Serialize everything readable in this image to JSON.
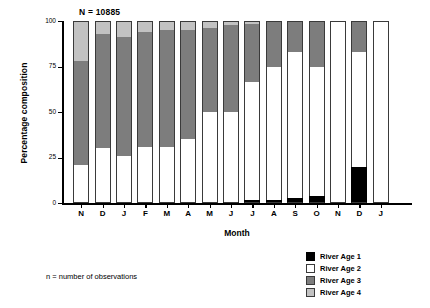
{
  "chart_data": {
    "type": "bar",
    "subtype": "stacked-percentage",
    "title": "",
    "annotation": "N = 10885",
    "xlabel": "Month",
    "ylabel": "Percentage composition",
    "ylim": [
      0,
      100
    ],
    "yticks": [
      0,
      25,
      50,
      75,
      100
    ],
    "ytick_labels": [
      "0",
      "25",
      "50",
      "75",
      "100"
    ],
    "grid": false,
    "legend_position": "bottom-right",
    "categories": [
      "N",
      "D",
      "J",
      "F",
      "M",
      "A",
      "M",
      "J",
      "J",
      "A",
      "S",
      "O",
      "N",
      "D",
      "J"
    ],
    "series": [
      {
        "name": "River Age 1",
        "color": "#000000",
        "values": [
          0,
          0,
          0,
          0,
          0,
          0,
          0,
          0.5,
          1.5,
          1.5,
          3,
          4,
          0,
          20,
          0
        ]
      },
      {
        "name": "River Age 2",
        "color": "#ffffff",
        "values": [
          21,
          30,
          26,
          31,
          31,
          35,
          50,
          49.5,
          65,
          73.5,
          80,
          71,
          100,
          63,
          100
        ]
      },
      {
        "name": "River Age 3",
        "color": "#7d7d7d",
        "values": [
          57,
          63,
          65,
          63,
          64,
          60,
          46,
          48,
          32,
          25,
          17,
          25,
          0,
          17,
          0
        ]
      },
      {
        "name": "River Age 4",
        "color": "#c2c2c2",
        "values": [
          22,
          7,
          9,
          6,
          5,
          5,
          4,
          2,
          1.5,
          0,
          0,
          0,
          0,
          0,
          0
        ]
      }
    ]
  },
  "footnote": "n = number of observations",
  "legend": {
    "items": [
      {
        "label": "River Age 1",
        "swatch": "sw1"
      },
      {
        "label": "River Age 2",
        "swatch": "sw2"
      },
      {
        "label": "River Age 3",
        "swatch": "sw3"
      },
      {
        "label": "River Age 4",
        "swatch": "sw4"
      }
    ]
  }
}
